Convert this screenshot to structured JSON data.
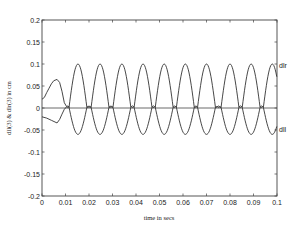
{
  "chart_data": {
    "type": "line",
    "title": "",
    "xlabel": "time in secs",
    "ylabel": "dll(3) & dlr(3) in cm",
    "xlim": [
      0,
      0.1
    ],
    "ylim": [
      -0.2,
      0.2
    ],
    "grid": false,
    "legend": "inline labels at right end of curves",
    "x_ticks": [
      0,
      0.01,
      0.02,
      0.03,
      0.04,
      0.05,
      0.06,
      0.07,
      0.08,
      0.09,
      0.1
    ],
    "x_tick_labels": [
      "0",
      "0.01",
      "0.02",
      "0.03",
      "0.04",
      "0.05",
      "0.06",
      "0.07",
      "0.08",
      "0.09",
      "0.1"
    ],
    "y_ticks": [
      -0.2,
      -0.15,
      -0.1,
      -0.05,
      0,
      0.05,
      0.1,
      0.15,
      0.2
    ],
    "y_tick_labels": [
      "-0.2",
      "-0.15",
      "-0.1",
      "-0.05",
      "0",
      "0.05",
      "0.1",
      "0.15",
      "0.2"
    ],
    "series": [
      {
        "name": "dlr",
        "label": "dlr",
        "transient": [
          [
            0,
            0.02
          ],
          [
            0.001,
            0.024
          ],
          [
            0.002,
            0.035
          ],
          [
            0.003,
            0.045
          ],
          [
            0.004,
            0.055
          ],
          [
            0.005,
            0.062
          ],
          [
            0.0064,
            0.065
          ],
          [
            0.0075,
            0.058
          ],
          [
            0.0085,
            0.038
          ],
          [
            0.0095,
            0.012
          ],
          [
            0.0105,
            0.003
          ]
        ],
        "cycle_peak_times": [
          0.0153,
          0.0247,
          0.034,
          0.043,
          0.052,
          0.061,
          0.07,
          0.08,
          0.089,
          0.098
        ],
        "cycle_peak_value": 0.1,
        "lobe_half_width": 0.0038,
        "dwell_value": 0.003
      },
      {
        "name": "dll",
        "label": "dll",
        "transient": [
          [
            0,
            -0.02
          ],
          [
            0.002,
            -0.023
          ],
          [
            0.004,
            -0.028
          ],
          [
            0.0064,
            -0.034
          ],
          [
            0.0075,
            -0.026
          ],
          [
            0.0085,
            -0.014
          ],
          [
            0.0095,
            -0.003
          ],
          [
            0.0105,
            0.003
          ]
        ],
        "cycle_peak_times": [
          0.0153,
          0.0247,
          0.034,
          0.043,
          0.052,
          0.061,
          0.07,
          0.08,
          0.089,
          0.098
        ],
        "cycle_peak_value": -0.06,
        "lobe_half_width": 0.0038,
        "dwell_value": 0.003
      }
    ],
    "reference_lines": [
      {
        "y": 0
      }
    ]
  }
}
